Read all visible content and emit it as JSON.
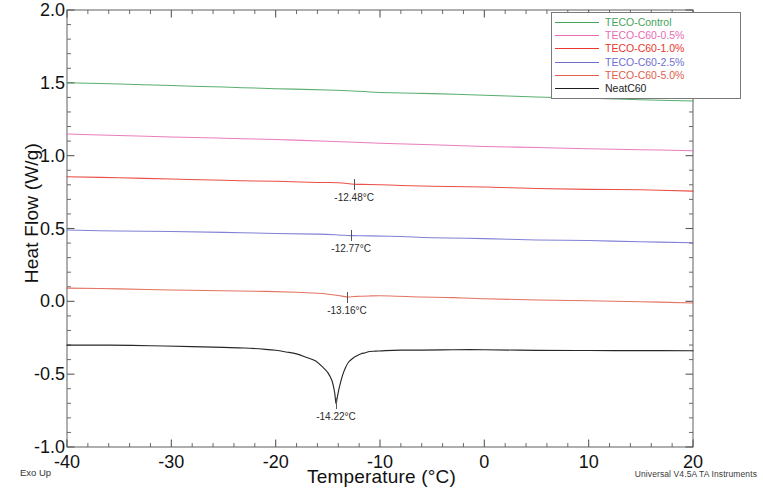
{
  "chart_data": {
    "type": "line",
    "title": "",
    "xlabel": "Temperature (°C)",
    "ylabel": "Heat Flow (W/g)",
    "xlim": [
      -40,
      20
    ],
    "ylim": [
      -1.0,
      2.0
    ],
    "xticks": [
      -40,
      -30,
      -20,
      -10,
      0,
      10,
      20
    ],
    "xtick_labels": [
      "-40",
      "-30",
      "-20",
      "-10",
      "0",
      "10",
      "20"
    ],
    "yticks": [
      -1.0,
      -0.5,
      0.0,
      0.5,
      1.0,
      1.5,
      2.0
    ],
    "ytick_labels": [
      "-1.0",
      "-0.5",
      "0.0",
      "0.5",
      "1.0",
      "1.5",
      "2.0"
    ],
    "x_minor_step": 2,
    "y_minor_step": 0.1,
    "grid": false,
    "legend_position": "top-right",
    "orientation_note": "Exo Up",
    "instrument": "Universal V4.5A TA Instruments",
    "series": [
      {
        "name": "TECO-Control",
        "color": "#44a35a",
        "x": [
          -40,
          -35,
          -30,
          -25,
          -20,
          -15,
          -13,
          -10,
          -5,
          0,
          5,
          10,
          15,
          20
        ],
        "values": [
          1.5,
          1.49,
          1.48,
          1.47,
          1.46,
          1.45,
          1.445,
          1.435,
          1.425,
          1.415,
          1.405,
          1.395,
          1.385,
          1.375
        ]
      },
      {
        "name": "TECO-C60-0.5%",
        "color": "#e86bb4",
        "x": [
          -40,
          -35,
          -30,
          -25,
          -20,
          -15,
          -13,
          -10,
          -5,
          0,
          5,
          10,
          15,
          20
        ],
        "values": [
          1.15,
          1.14,
          1.13,
          1.12,
          1.11,
          1.1,
          1.095,
          1.085,
          1.075,
          1.065,
          1.055,
          1.048,
          1.042,
          1.035
        ]
      },
      {
        "name": "TECO-C60-1.0%",
        "color": "#e8372e",
        "x": [
          -40,
          -35,
          -30,
          -25,
          -20,
          -16,
          -14,
          -12.48,
          -11,
          -8,
          -5,
          0,
          5,
          10,
          15,
          20
        ],
        "values": [
          0.855,
          0.848,
          0.84,
          0.832,
          0.824,
          0.817,
          0.812,
          0.806,
          0.802,
          0.796,
          0.79,
          0.783,
          0.776,
          0.77,
          0.764,
          0.758
        ],
        "annotation": {
          "label": "-12.48°C",
          "x": -12.48,
          "y": 0.806
        }
      },
      {
        "name": "TECO-C60-2.5%",
        "color": "#6f6fd0",
        "x": [
          -40,
          -35,
          -30,
          -25,
          -20,
          -16,
          -14,
          -12.77,
          -11,
          -8,
          -5,
          0,
          5,
          10,
          15,
          20
        ],
        "values": [
          0.49,
          0.484,
          0.478,
          0.472,
          0.466,
          0.461,
          0.457,
          0.452,
          0.449,
          0.443,
          0.437,
          0.429,
          0.422,
          0.416,
          0.41,
          0.404
        ],
        "annotation": {
          "label": "-12.77°C",
          "x": -12.77,
          "y": 0.452
        }
      },
      {
        "name": "TECO-C60-5.0%",
        "color": "#e0604c",
        "x": [
          -40,
          -35,
          -30,
          -25,
          -21,
          -18,
          -16,
          -15,
          -14,
          -13.16,
          -12.5,
          -12,
          -11,
          -9,
          -6,
          -3,
          0,
          5,
          10,
          15,
          20
        ],
        "values": [
          0.09,
          0.085,
          0.079,
          0.073,
          0.068,
          0.063,
          0.057,
          0.05,
          0.04,
          0.03,
          0.032,
          0.036,
          0.038,
          0.036,
          0.03,
          0.024,
          0.018,
          0.01,
          0.003,
          -0.003,
          -0.01
        ],
        "annotation": {
          "label": "-13.16°C",
          "x": -13.16,
          "y": 0.03
        }
      },
      {
        "name": "NeatC60",
        "color": "#1c1c1c",
        "x": [
          -40,
          -36,
          -32,
          -28,
          -25,
          -23,
          -21,
          -20,
          -19,
          -18,
          -17,
          -16.2,
          -15.5,
          -15,
          -14.6,
          -14.35,
          -14.22,
          -14.1,
          -13.9,
          -13.6,
          -13.3,
          -13.0,
          -12.6,
          -12.2,
          -11.8,
          -11.4,
          -11.0,
          -10.4,
          -9.5,
          -8,
          -6,
          -3,
          0,
          5,
          10,
          15,
          20
        ],
        "values": [
          -0.3,
          -0.302,
          -0.305,
          -0.31,
          -0.315,
          -0.32,
          -0.33,
          -0.337,
          -0.347,
          -0.362,
          -0.385,
          -0.41,
          -0.45,
          -0.49,
          -0.545,
          -0.625,
          -0.7,
          -0.66,
          -0.59,
          -0.51,
          -0.455,
          -0.418,
          -0.39,
          -0.372,
          -0.36,
          -0.352,
          -0.346,
          -0.341,
          -0.337,
          -0.335,
          -0.334,
          -0.334,
          -0.334,
          -0.335,
          -0.336,
          -0.337,
          -0.338
        ],
        "annotation": {
          "label": "-14.22°C",
          "x": -14.22,
          "y": -0.7
        }
      }
    ]
  },
  "legend": {
    "entries": [
      {
        "label": "TECO-Control"
      },
      {
        "label": "TECO-C60-0.5%"
      },
      {
        "label": "TECO-C60-1.0%"
      },
      {
        "label": "TECO-C60-2.5%"
      },
      {
        "label": "TECO-C60-5.0%"
      },
      {
        "label": "NeatC60"
      }
    ]
  },
  "footer": {
    "exo_up": "Exo Up",
    "credit": "Universal V4.5A TA Instruments"
  }
}
